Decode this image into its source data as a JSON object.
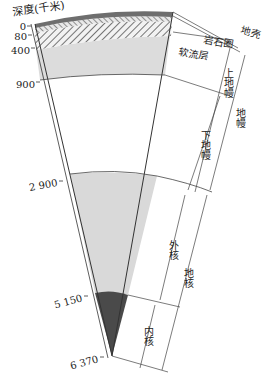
{
  "title": "深度(千米)",
  "depth_ticks": [
    {
      "label": "0",
      "depth": 0
    },
    {
      "label": "80",
      "depth": 80
    },
    {
      "label": "400",
      "depth": 400
    },
    {
      "label": "900",
      "depth": 900
    },
    {
      "label": "2 900",
      "depth": 2900
    },
    {
      "label": "5 150",
      "depth": 5150
    },
    {
      "label": "6 370",
      "depth": 6370
    }
  ],
  "layers": {
    "crust": "地壳",
    "lithosphere": "岩石圈",
    "asthenosphere": "软流层",
    "upper_mantle": "上地幔",
    "lower_mantle": "下地幔",
    "mantle": "地幔",
    "outer_core": "外核",
    "inner_core": "内核",
    "core": "地核"
  },
  "colors": {
    "crust": "#6e6e6e",
    "lithosphere_hatch": "#555555",
    "upper_mantle": "#dcdcdc",
    "outer_core": "#d9d9d9",
    "inner_core": "#4a4a4a",
    "line": "#333333"
  }
}
